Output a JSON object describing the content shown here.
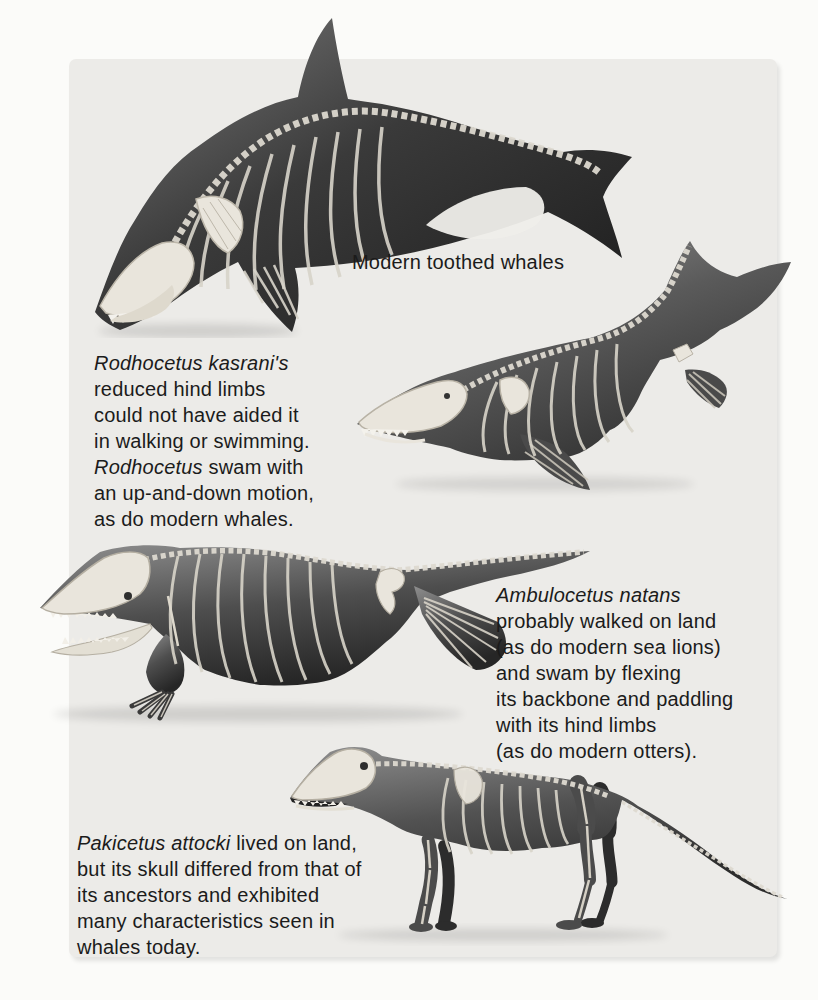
{
  "page": {
    "background": "#fbfbf9",
    "panel_background": "#ecebe8"
  },
  "labels": {
    "modern_whales": "Modern toothed whales"
  },
  "captions": {
    "rodhocetus": {
      "lines": [
        [
          {
            "text": "Rodhocetus kasrani's",
            "italic": true
          }
        ],
        [
          {
            "text": "reduced hind limbs"
          }
        ],
        [
          {
            "text": "could not have aided it"
          }
        ],
        [
          {
            "text": "in walking or swimming."
          }
        ],
        [
          {
            "text": "Rodhocetus",
            "italic": true
          },
          {
            "text": " swam with"
          }
        ],
        [
          {
            "text": "an up-and-down motion,"
          }
        ],
        [
          {
            "text": "as do modern whales."
          }
        ]
      ]
    },
    "ambulocetus": {
      "lines": [
        [
          {
            "text": "Ambulocetus natans",
            "italic": true
          }
        ],
        [
          {
            "text": "probably walked on land"
          }
        ],
        [
          {
            "text": "(as do modern sea lions)"
          }
        ],
        [
          {
            "text": "and swam by flexing"
          }
        ],
        [
          {
            "text": "its backbone and paddling"
          }
        ],
        [
          {
            "text": "with its hind limbs"
          }
        ],
        [
          {
            "text": "(as do modern otters)."
          }
        ]
      ]
    },
    "pakicetus": {
      "lines": [
        [
          {
            "text": "Pakicetus attocki",
            "italic": true
          },
          {
            "text": " lived on land,"
          }
        ],
        [
          {
            "text": "but its skull differed from that of"
          }
        ],
        [
          {
            "text": "its ancestors and exhibited"
          }
        ],
        [
          {
            "text": "many characteristics seen in"
          }
        ],
        [
          {
            "text": "whales today."
          }
        ]
      ]
    }
  },
  "illustration_colors": {
    "body_dark": "#1f1f1f",
    "body_mid": "#6e6e6e",
    "skeleton": "#e9e5dc",
    "skeleton_line": "#b8b2a5",
    "text": "#1b1b1b"
  }
}
